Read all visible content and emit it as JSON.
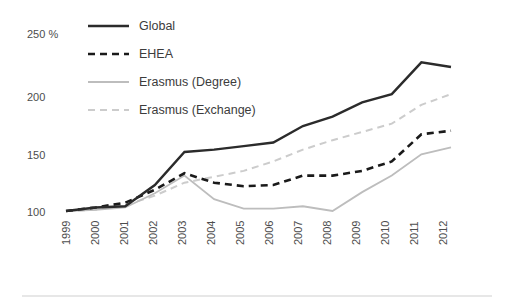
{
  "chart_data": {
    "type": "line",
    "title": "",
    "subtitle": "",
    "xlabel": "",
    "ylabel": "",
    "unit_label": "250 %",
    "x": [
      "1999",
      "2000",
      "2001",
      "2002",
      "2003",
      "2004",
      "2005",
      "2006",
      "2007",
      "2008",
      "2009",
      "2010",
      "2011",
      "2012"
    ],
    "categories": [
      "1999",
      "2000",
      "2001",
      "2002",
      "2003",
      "2004",
      "2005",
      "2006",
      "2007",
      "2008",
      "2009",
      "2010",
      "2011",
      "2012"
    ],
    "xtick_labels": [
      "1999",
      "2000",
      "2001",
      "2002",
      "2003",
      "2004",
      "2005",
      "2006",
      "2007",
      "2008",
      "2009",
      "2010",
      "2011",
      "2012"
    ],
    "ytick_labels": [
      "250 %",
      "200",
      "150",
      "100"
    ],
    "ytick_values": [
      250,
      200,
      150,
      100
    ],
    "ylim": [
      95,
      255
    ],
    "xlim": [
      "1999",
      "2012"
    ],
    "grid": false,
    "legend_position": "top-center",
    "index_base": 100,
    "series": [
      {
        "name": "Global",
        "style": "solid",
        "color": "#2b2b2b",
        "values": [
          100,
          103,
          104,
          122,
          150,
          152,
          155,
          158,
          172,
          180,
          192,
          199,
          226,
          222
        ]
      },
      {
        "name": "EHEA",
        "style": "dashed",
        "color": "#1a1a1a",
        "values": [
          100,
          103,
          107,
          118,
          132,
          124,
          121,
          122,
          130,
          130,
          134,
          142,
          165,
          168
        ]
      },
      {
        "name": "Erasmus (Degree)",
        "style": "solid",
        "color": "#bdbdbd",
        "values": [
          100,
          101,
          103,
          115,
          130,
          110,
          102,
          102,
          104,
          100,
          116,
          130,
          148,
          154
        ]
      },
      {
        "name": "Erasmus (Exchange)",
        "style": "dashed",
        "color": "#cccccc",
        "values": [
          100,
          101,
          105,
          113,
          124,
          129,
          134,
          142,
          152,
          160,
          167,
          174,
          190,
          199
        ]
      }
    ],
    "legend": [
      {
        "label": "Global",
        "style": "solid",
        "color": "#2b2b2b"
      },
      {
        "label": "EHEA",
        "style": "dashed",
        "color": "#1a1a1a"
      },
      {
        "label": "Erasmus (Degree)",
        "style": "solid",
        "color": "#bdbdbd"
      },
      {
        "label": "Erasmus (Exchange)",
        "style": "dashed",
        "color": "#cccccc"
      }
    ]
  },
  "colors": {
    "background": "#ffffff",
    "global": "#2b2b2b",
    "ehea": "#1a1a1a",
    "erasmus_degree": "#bdbdbd",
    "erasmus_exchange": "#cccccc",
    "tick_text": "#4d4d4d",
    "legend_text": "#3c3c3c",
    "baseline_rule": "#cfcfcf"
  }
}
